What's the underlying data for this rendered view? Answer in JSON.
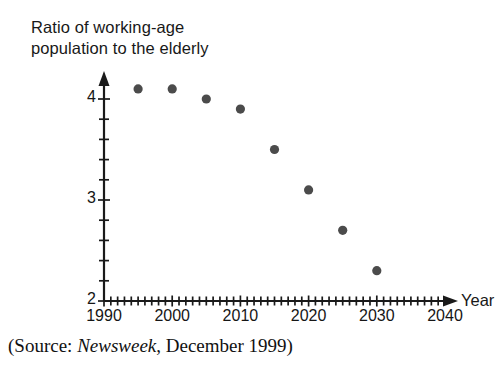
{
  "chart_data": {
    "type": "scatter",
    "title": "Ratio of working-age population to the elderly",
    "title_line1": "Ratio of working-age",
    "title_line2": "population to the elderly",
    "xlabel": "Year",
    "ylabel": "Ratio of working-age population to the elderly",
    "xlim": [
      1990,
      2045
    ],
    "ylim": [
      2,
      4.25
    ],
    "grid": false,
    "legend": null,
    "x_tick_labels": [
      "1990",
      "2000",
      "2010",
      "2020",
      "2030",
      "2040"
    ],
    "x_tick_values": [
      1990,
      2000,
      2010,
      2020,
      2030,
      2040
    ],
    "x_minor_tick_interval": 1,
    "y_tick_labels": [
      "2",
      "3",
      "4"
    ],
    "y_tick_values": [
      2,
      3,
      4
    ],
    "y_minor_tick_interval": 0.2,
    "marker": "circle",
    "marker_color": "#4b4b4b",
    "axis_color": "#1a1a1a",
    "x": [
      1995,
      2000,
      2005,
      2010,
      2015,
      2020,
      2025,
      2030
    ],
    "values": [
      4.1,
      4.1,
      4.0,
      3.9,
      3.5,
      3.1,
      2.7,
      2.3
    ],
    "points": [
      {
        "x": 1995,
        "y": 4.1
      },
      {
        "x": 2000,
        "y": 4.1
      },
      {
        "x": 2005,
        "y": 4.0
      },
      {
        "x": 2010,
        "y": 3.9
      },
      {
        "x": 2015,
        "y": 3.5
      },
      {
        "x": 2020,
        "y": 3.1
      },
      {
        "x": 2025,
        "y": 2.7
      },
      {
        "x": 2030,
        "y": 2.3
      }
    ]
  },
  "caption": {
    "prefix": "(Source: ",
    "italic_source": "Newsweek",
    "suffix": ", December 1999)"
  },
  "axis_name": {
    "x": "Year"
  }
}
